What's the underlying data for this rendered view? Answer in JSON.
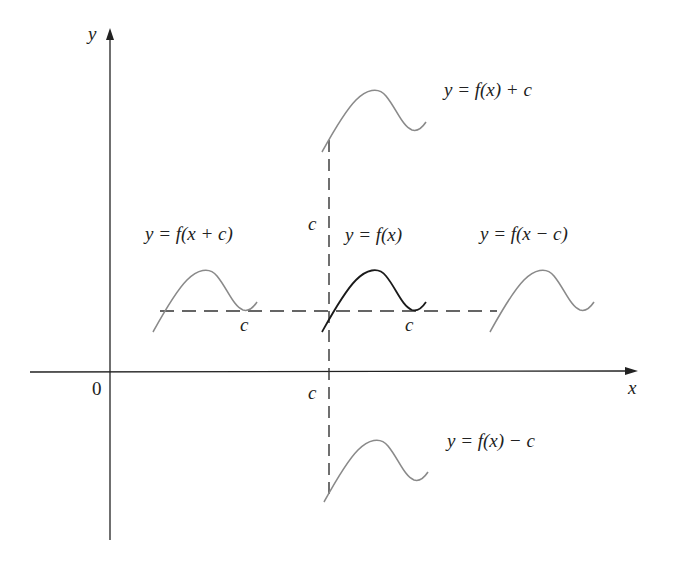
{
  "figure": {
    "type": "function-translation-diagram",
    "axes": {
      "x_label": "x",
      "y_label": "y",
      "origin_label": "0"
    },
    "shift_label": "c",
    "colors": {
      "axis": "#222222",
      "original_curve": "#1a1a1a",
      "shifted_curve": "#8a8a8a",
      "dashed_guides": "#333333"
    },
    "curves": [
      {
        "id": "original",
        "label": "y = f(x)"
      },
      {
        "id": "shift-up",
        "label": "y = f(x) + c"
      },
      {
        "id": "shift-down",
        "label": "y = f(x) − c"
      },
      {
        "id": "shift-left",
        "label": "y = f(x + c)"
      },
      {
        "id": "shift-right",
        "label": "y = f(x − c)"
      }
    ]
  }
}
